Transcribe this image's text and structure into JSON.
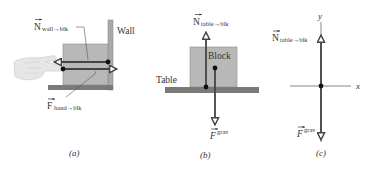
{
  "figure": {
    "colors": {
      "block_fill": "#b8b8b8",
      "block_stroke": "#8a8a8a",
      "surface_fill": "#7a7a7a",
      "wall_fill": "#a9a9a9",
      "force_line": "#444444",
      "dot": "#111111",
      "axis": "#555555",
      "text": "#333333",
      "hand_fill": "#e6e6e6"
    },
    "panels": [
      {
        "id": "a",
        "caption": "(a)",
        "labels": {
          "wall": "Wall",
          "normal_main": "N",
          "normal_sub": "wall→blk",
          "hand_main": "F",
          "hand_sub": "hand→blk"
        },
        "forces": [
          {
            "name": "N_wall_to_blk",
            "direction": "left"
          },
          {
            "name": "F_hand_to_blk",
            "direction": "right"
          }
        ]
      },
      {
        "id": "b",
        "caption": "(b)",
        "labels": {
          "table": "Table",
          "block": "Block",
          "normal_main": "N",
          "normal_sub": "table→blk",
          "grav_main": "F",
          "grav_sup": "grav"
        },
        "forces": [
          {
            "name": "N_table_to_blk",
            "direction": "up"
          },
          {
            "name": "F_grav",
            "direction": "down"
          }
        ]
      },
      {
        "id": "c",
        "caption": "(c)",
        "labels": {
          "x_axis": "x",
          "y_axis": "y",
          "normal_main": "N",
          "normal_sub": "table→blk",
          "grav_main": "F",
          "grav_sup": "grav"
        },
        "forces": [
          {
            "name": "N_table_to_blk",
            "direction": "up"
          },
          {
            "name": "F_grav",
            "direction": "down"
          }
        ]
      }
    ]
  }
}
